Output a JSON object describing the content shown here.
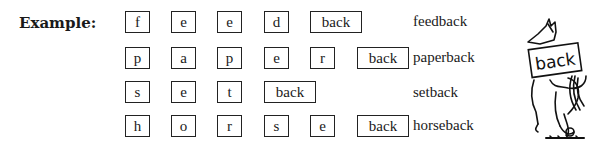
{
  "example_label": "Example:",
  "rows": [
    {
      "letters": [
        "f",
        "e",
        "e",
        "d"
      ],
      "suffix": "back",
      "word": "feedback"
    },
    {
      "letters": [
        "p",
        "a",
        "p",
        "e",
        "r"
      ],
      "suffix": "back",
      "word": "paperback"
    },
    {
      "letters": [
        "s",
        "e",
        "t"
      ],
      "suffix": "back",
      "word": "setback"
    },
    {
      "letters": [
        "h",
        "o",
        "r",
        "s",
        "e"
      ],
      "suffix": "back",
      "word": "horseback"
    }
  ],
  "illustration": {
    "sign_text": "back",
    "subject": "horse carrying a sign"
  }
}
